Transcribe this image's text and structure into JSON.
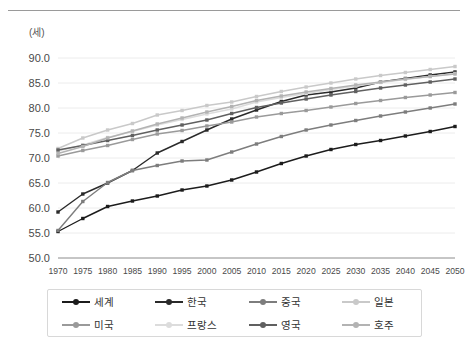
{
  "unit_label": "(세)",
  "chart_data": {
    "type": "line",
    "title": "",
    "xlabel": "",
    "ylabel": "(세)",
    "ylim": [
      50.0,
      90.0
    ],
    "ytick_step": 5.0,
    "ytick_labels": [
      "90.0",
      "85.0",
      "80.0",
      "75.0",
      "70.0",
      "65.0",
      "60.0",
      "55.0",
      "50.0"
    ],
    "ytick_values": [
      90.0,
      85.0,
      80.0,
      75.0,
      70.0,
      65.0,
      60.0,
      55.0,
      50.0
    ],
    "grid": true,
    "legend_position": "bottom",
    "categories": [
      "1970",
      "1975",
      "1980",
      "1985",
      "1990",
      "1995",
      "2000",
      "2005",
      "2010",
      "2015",
      "2020",
      "2025",
      "2030",
      "2035",
      "2040",
      "2045",
      "2050"
    ],
    "x": [
      1970,
      1975,
      1980,
      1985,
      1990,
      1995,
      2000,
      2005,
      2010,
      2015,
      2020,
      2025,
      2030,
      2035,
      2040,
      2045,
      2050
    ],
    "series": [
      {
        "name": "세계",
        "color": "#1c1c1c",
        "values": [
          55.3,
          57.9,
          60.3,
          61.4,
          62.4,
          63.6,
          64.4,
          65.6,
          67.2,
          68.9,
          70.4,
          71.7,
          72.7,
          73.5,
          74.4,
          75.3,
          76.3
        ]
      },
      {
        "name": "한국",
        "color": "#2a2a2a",
        "values": [
          59.2,
          62.8,
          65.0,
          67.5,
          71.0,
          73.3,
          75.6,
          77.8,
          79.6,
          81.3,
          82.6,
          83.2,
          84.0,
          85.2,
          85.9,
          86.6,
          87.2
        ]
      },
      {
        "name": "중국",
        "color": "#7d7d7d",
        "values": [
          55.5,
          61.3,
          65.1,
          67.5,
          68.5,
          69.4,
          69.6,
          71.2,
          72.8,
          74.3,
          75.6,
          76.6,
          77.5,
          78.4,
          79.2,
          80.0,
          80.8
        ]
      },
      {
        "name": "일본",
        "color": "#c9c9c9",
        "values": [
          71.9,
          74.0,
          75.6,
          76.9,
          78.6,
          79.5,
          80.5,
          81.2,
          82.3,
          83.3,
          84.2,
          85.0,
          85.8,
          86.5,
          87.1,
          87.7,
          88.3
        ]
      },
      {
        "name": "미국",
        "color": "#9a9a9a",
        "values": [
          70.4,
          71.5,
          72.5,
          73.7,
          74.8,
          75.5,
          76.4,
          77.2,
          78.2,
          78.9,
          79.5,
          80.2,
          80.9,
          81.5,
          82.1,
          82.6,
          83.1
        ]
      },
      {
        "name": "프랑스",
        "color": "#dcdcdc",
        "values": [
          71.4,
          72.6,
          74.1,
          75.3,
          76.6,
          77.7,
          78.8,
          79.8,
          81.2,
          82.1,
          82.9,
          83.7,
          84.4,
          85.1,
          85.7,
          86.3,
          86.9
        ]
      },
      {
        "name": "영국",
        "color": "#606060",
        "values": [
          71.6,
          72.5,
          73.5,
          74.5,
          75.6,
          76.6,
          77.6,
          78.9,
          80.1,
          81.0,
          81.8,
          82.6,
          83.3,
          84.0,
          84.6,
          85.2,
          85.8
        ]
      },
      {
        "name": "호주",
        "color": "#b3b3b3",
        "values": [
          70.9,
          72.3,
          74.0,
          75.4,
          76.8,
          78.0,
          79.2,
          80.3,
          81.5,
          82.4,
          83.2,
          83.9,
          84.6,
          85.2,
          85.8,
          86.3,
          86.8
        ]
      }
    ]
  },
  "legend": {
    "items": [
      {
        "label": "세계"
      },
      {
        "label": "한국"
      },
      {
        "label": "중국"
      },
      {
        "label": "일본"
      },
      {
        "label": "미국"
      },
      {
        "label": "프랑스"
      },
      {
        "label": "영국"
      },
      {
        "label": "호주"
      }
    ]
  }
}
